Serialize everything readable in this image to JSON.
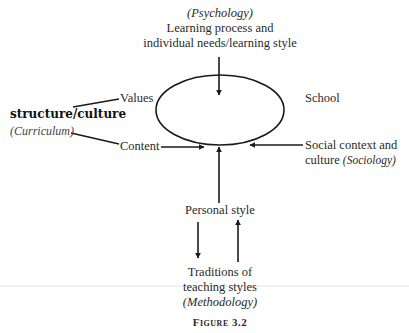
{
  "diagram": {
    "center": {
      "label": "School",
      "shape": "ellipse"
    },
    "top": {
      "discipline": "(Psychology)",
      "line1": "Learning process and",
      "line2": "individual needs/learning style"
    },
    "left": {
      "title": "structure/culture",
      "discipline": "(Curriculum)",
      "values": "Values",
      "content": "Content"
    },
    "right": {
      "line1": "Social context and",
      "line2_prefix": "culture ",
      "discipline": "(Sociology)"
    },
    "bottom": {
      "personal_style": "Personal style",
      "traditions_line1": "Traditions of",
      "traditions_line2": "teaching styles",
      "discipline": "(Methodology)"
    },
    "caption": "Figure 3.2",
    "colors": {
      "stroke": "#1a1a1a",
      "text": "#2a2a2a",
      "background": "#ffffff"
    }
  }
}
